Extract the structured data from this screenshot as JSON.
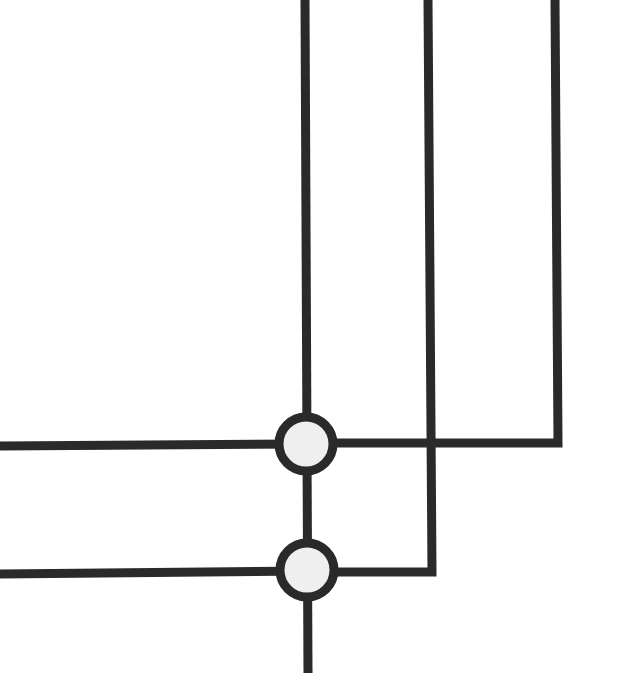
{
  "diagram": {
    "type": "wiring-junction-diagram",
    "colors": {
      "line": "#2a2a2a",
      "background": "#ffffff",
      "junction_fill": "#efefef"
    },
    "stroke_width": 9,
    "lines": [
      {
        "id": "vertical-1",
        "points": [
          [
            305,
            0
          ],
          [
            308,
            673
          ]
        ]
      },
      {
        "id": "vertical-2",
        "points": [
          [
            428,
            0
          ],
          [
            432,
            572
          ],
          [
            308,
            572
          ]
        ]
      },
      {
        "id": "vertical-3",
        "points": [
          [
            555,
            0
          ],
          [
            558,
            443
          ],
          [
            305,
            443
          ]
        ]
      },
      {
        "id": "horizontal-1",
        "points": [
          [
            0,
            446
          ],
          [
            305,
            444
          ]
        ]
      },
      {
        "id": "horizontal-2",
        "points": [
          [
            0,
            574
          ],
          [
            307,
            571
          ]
        ]
      }
    ],
    "junctions": [
      {
        "id": "junction-1",
        "cx": 306,
        "cy": 444,
        "r": 27
      },
      {
        "id": "junction-2",
        "cx": 307,
        "cy": 570,
        "r": 27
      }
    ]
  }
}
